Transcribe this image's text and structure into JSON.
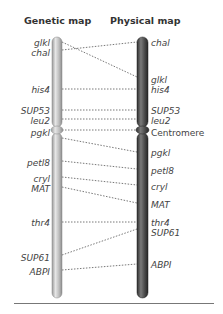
{
  "headers": {
    "genetic": "Genetic map",
    "physical": "Physical map"
  },
  "genetic_map": {
    "labels": [
      {
        "text": "glkl",
        "y": 38
      },
      {
        "text": "chal",
        "y": 48
      },
      {
        "text": "his4",
        "y": 85
      },
      {
        "text": "SUP53",
        "y": 106
      },
      {
        "text": "leu2",
        "y": 116
      },
      {
        "text": "pgkl",
        "y": 128
      },
      {
        "text": "petl8",
        "y": 158
      },
      {
        "text": "cryl",
        "y": 174
      },
      {
        "text": "MAT",
        "y": 184
      },
      {
        "text": "thr4",
        "y": 218
      },
      {
        "text": "SUP61",
        "y": 253
      },
      {
        "text": "ABPI",
        "y": 267
      }
    ],
    "color": "#b9b9b9"
  },
  "physical_map": {
    "labels": [
      {
        "text": "chal",
        "y": 38
      },
      {
        "text": "glkl",
        "y": 75
      },
      {
        "text": "his4",
        "y": 85
      },
      {
        "text": "SUP53",
        "y": 106
      },
      {
        "text": "leu2",
        "y": 116
      },
      {
        "text": "Centromere",
        "y": 128,
        "plain": true
      },
      {
        "text": "pgkl",
        "y": 148
      },
      {
        "text": "petl8",
        "y": 166
      },
      {
        "text": "cryl",
        "y": 182
      },
      {
        "text": "MAT",
        "y": 200
      },
      {
        "text": "thr4",
        "y": 218
      },
      {
        "text": "SUP61",
        "y": 228
      },
      {
        "text": "ABPI",
        "y": 260
      }
    ],
    "color": "#555555"
  },
  "links": [
    {
      "gene": "glkl",
      "from_y": 42,
      "to_y": 77
    },
    {
      "gene": "chal",
      "from_y": 50,
      "to_y": 42
    },
    {
      "gene": "his4",
      "from_y": 89,
      "to_y": 89
    },
    {
      "gene": "SUP53",
      "from_y": 110,
      "to_y": 110
    },
    {
      "gene": "leu2",
      "from_y": 119,
      "to_y": 119
    },
    {
      "gene": "centromere",
      "from_y": 130,
      "to_y": 130
    },
    {
      "gene": "pgkl",
      "from_y": 138,
      "to_y": 152
    },
    {
      "gene": "petl8",
      "from_y": 161,
      "to_y": 169
    },
    {
      "gene": "cryl",
      "from_y": 177,
      "to_y": 185
    },
    {
      "gene": "MAT",
      "from_y": 187,
      "to_y": 203
    },
    {
      "gene": "thr4",
      "from_y": 222,
      "to_y": 222
    },
    {
      "gene": "SUP61",
      "from_y": 255,
      "to_y": 229
    },
    {
      "gene": "ABPI",
      "from_y": 270,
      "to_y": 264
    }
  ]
}
